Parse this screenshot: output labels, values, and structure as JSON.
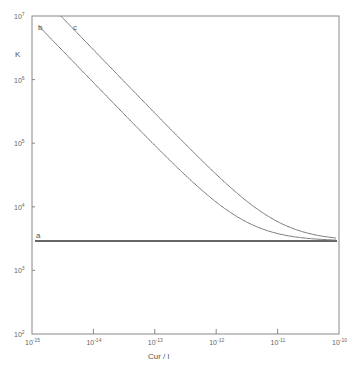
{
  "chart_data": {
    "type": "line",
    "title": "",
    "xlabel": "Cur / l",
    "ylabel": "K",
    "xscale": "log",
    "yscale": "log",
    "xlim": [
      1e-15,
      1e-10
    ],
    "ylim": [
      100,
      10000000
    ],
    "grid": false,
    "legend": "inline labels near curves",
    "x_ticks": [
      {
        "exp": "-15",
        "value": 1e-15
      },
      {
        "exp": "-14",
        "value": 1e-14
      },
      {
        "exp": "-13",
        "value": 1e-13
      },
      {
        "exp": "-12",
        "value": 1e-12
      },
      {
        "exp": "-11",
        "value": 1e-11
      },
      {
        "exp": "-10",
        "value": 1e-10
      }
    ],
    "y_ticks": [
      {
        "exp": "2",
        "value": 100
      },
      {
        "exp": "3",
        "value": 1000
      },
      {
        "exp": "4",
        "value": 10000
      },
      {
        "exp": "5",
        "value": 100000
      },
      {
        "exp": "6",
        "value": 1000000
      },
      {
        "exp": "7",
        "value": 10000000
      }
    ],
    "series": [
      {
        "name": "a",
        "description": "constant K, independent of Cur",
        "x": [
          1e-15,
          1e-14,
          1e-13,
          1e-12,
          1e-11,
          1e-10
        ],
        "y": [
          2900,
          2900,
          2900,
          2900,
          2900,
          2900
        ]
      },
      {
        "name": "b",
        "description": "K decreases ~1/Cur, merges with a near 1e-11",
        "x": [
          1.3e-15,
          1e-14,
          1e-13,
          1e-12,
          5e-12,
          1e-11,
          3e-11,
          1e-10
        ],
        "y": [
          6900000,
          870000,
          90000,
          11600,
          4640,
          3770,
          3190,
          2990
        ]
      },
      {
        "name": "c",
        "description": "K decreases ~1/Cur, merges with a near 4e-11",
        "x": [
          2.95e-15,
          1e-14,
          1e-13,
          1e-12,
          1e-11,
          4e-11,
          1e-10
        ],
        "y": [
          10000000,
          2950000,
          298000,
          32400,
          5850,
          3640,
          3200
        ]
      }
    ],
    "curve_labels": {
      "a": "a",
      "b": "b",
      "c": "c"
    }
  },
  "axes": {
    "x_title": "Cur / l",
    "y_title": "K",
    "tick_base": "10"
  }
}
